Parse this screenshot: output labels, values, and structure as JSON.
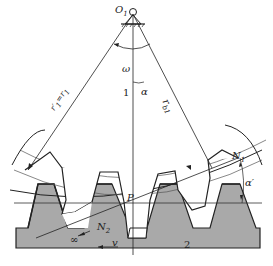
{
  "diagram": {
    "title": "",
    "type": "gear-rack meshing diagram",
    "colors": {
      "rack_fill": "#a9a9a9",
      "line": "#222222",
      "background": "#ffffff"
    },
    "labels": {
      "center": "O",
      "center_sub": "1",
      "omega": "ω",
      "gear_number": "1",
      "rack_number": "2",
      "alpha": "α",
      "alpha_prime": "α′",
      "r_b": "r",
      "r_b_sub": "b1",
      "r_pitch": "r′",
      "r_pitch_sub": "1",
      "r_pitch_eq": "=r",
      "r_pitch_eq_sub": "1",
      "pitch_point": "P",
      "n1": "N",
      "n1_sub": "1",
      "n2": "N",
      "n2_sub": "2",
      "infinity": "∞",
      "velocity": "v"
    }
  }
}
